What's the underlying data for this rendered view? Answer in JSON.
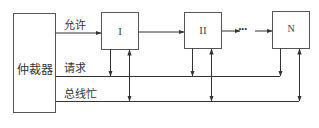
{
  "arbiter": {
    "label": "仲裁器"
  },
  "signals": {
    "grant": "允许",
    "request": "请求",
    "bus_busy": "总线忙"
  },
  "devices": [
    {
      "label": "I"
    },
    {
      "label": "II"
    },
    {
      "label": "N"
    }
  ],
  "ellipsis": "···",
  "colors": {
    "line": "#333333",
    "box_border": "#555555"
  }
}
